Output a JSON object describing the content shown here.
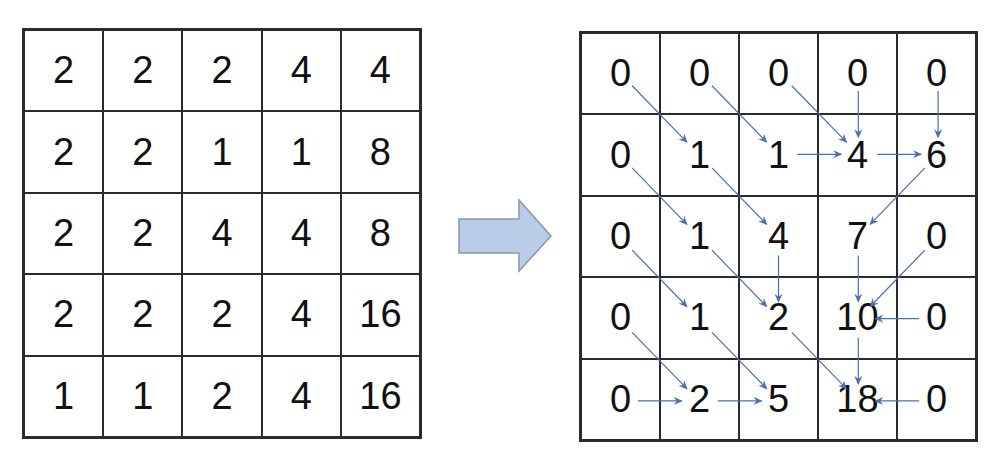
{
  "input_grid": {
    "rows": [
      [
        "2",
        "2",
        "2",
        "4",
        "4"
      ],
      [
        "2",
        "2",
        "1",
        "1",
        "8"
      ],
      [
        "2",
        "2",
        "4",
        "4",
        "8"
      ],
      [
        "2",
        "2",
        "2",
        "4",
        "16"
      ],
      [
        "1",
        "1",
        "2",
        "4",
        "16"
      ]
    ]
  },
  "transform_arrow": {
    "color": "#b9cde8",
    "stroke": "#8a96a8",
    "direction": "right"
  },
  "output_grid": {
    "rows": [
      [
        "0",
        "0",
        "0",
        "0",
        "0"
      ],
      [
        "0",
        "1",
        "1",
        "4",
        "6"
      ],
      [
        "0",
        "1",
        "4",
        "7",
        "0"
      ],
      [
        "0",
        "1",
        "2",
        "10",
        "0"
      ],
      [
        "0",
        "2",
        "5",
        "18",
        "0"
      ]
    ],
    "flow_arrow_color": "#4a6fb0",
    "flow_arrows": [
      {
        "from": [
          0,
          0
        ],
        "to": [
          1,
          1
        ]
      },
      {
        "from": [
          0,
          1
        ],
        "to": [
          1,
          2
        ]
      },
      {
        "from": [
          0,
          2
        ],
        "to": [
          1,
          3
        ]
      },
      {
        "from": [
          0,
          3
        ],
        "to": [
          1,
          3
        ]
      },
      {
        "from": [
          0,
          4
        ],
        "to": [
          1,
          4
        ]
      },
      {
        "from": [
          1,
          2
        ],
        "to": [
          1,
          3
        ]
      },
      {
        "from": [
          1,
          3
        ],
        "to": [
          1,
          4
        ]
      },
      {
        "from": [
          1,
          0
        ],
        "to": [
          2,
          1
        ]
      },
      {
        "from": [
          1,
          1
        ],
        "to": [
          2,
          2
        ]
      },
      {
        "from": [
          1,
          4
        ],
        "to": [
          2,
          3
        ]
      },
      {
        "from": [
          2,
          0
        ],
        "to": [
          3,
          1
        ]
      },
      {
        "from": [
          2,
          1
        ],
        "to": [
          3,
          2
        ]
      },
      {
        "from": [
          2,
          2
        ],
        "to": [
          3,
          2
        ]
      },
      {
        "from": [
          2,
          3
        ],
        "to": [
          3,
          3
        ]
      },
      {
        "from": [
          2,
          4
        ],
        "to": [
          3,
          3
        ]
      },
      {
        "from": [
          3,
          4
        ],
        "to": [
          3,
          3
        ]
      },
      {
        "from": [
          3,
          0
        ],
        "to": [
          4,
          1
        ]
      },
      {
        "from": [
          3,
          1
        ],
        "to": [
          4,
          2
        ]
      },
      {
        "from": [
          3,
          2
        ],
        "to": [
          4,
          3
        ]
      },
      {
        "from": [
          3,
          3
        ],
        "to": [
          4,
          3
        ]
      },
      {
        "from": [
          4,
          0
        ],
        "to": [
          4,
          1
        ]
      },
      {
        "from": [
          4,
          1
        ],
        "to": [
          4,
          2
        ]
      },
      {
        "from": [
          4,
          4
        ],
        "to": [
          4,
          3
        ]
      }
    ]
  }
}
